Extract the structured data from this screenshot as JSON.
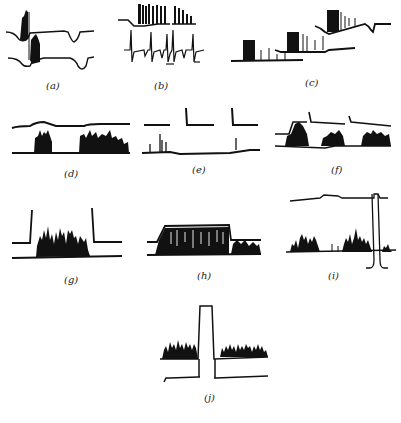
{
  "figure": {
    "ink_color": "#111111",
    "background": "#ffffff",
    "panels": [
      {
        "id": "a",
        "label": "(a)"
      },
      {
        "id": "b",
        "label": "(b)"
      },
      {
        "id": "c",
        "label": "(c)"
      },
      {
        "id": "d",
        "label": "(d)"
      },
      {
        "id": "e",
        "label": "(e)"
      },
      {
        "id": "f",
        "label": "(f)"
      },
      {
        "id": "g",
        "label": "(g)"
      },
      {
        "id": "h",
        "label": "(h)"
      },
      {
        "id": "i",
        "label": "(i)"
      },
      {
        "id": "j",
        "label": "(j)"
      }
    ]
  }
}
